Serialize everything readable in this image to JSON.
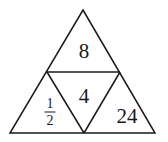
{
  "figure": {
    "name": "subdivided-equilateral-triangle",
    "background_color": "#ffffff",
    "stroke_color": "#1a1a1a",
    "stroke_width": 1.5,
    "outer_triangle": {
      "apex": {
        "x": 83,
        "y": 10
      },
      "bottom_left": {
        "x": 10,
        "y": 133
      },
      "bottom_right": {
        "x": 155,
        "y": 133
      }
    },
    "midpoints": {
      "left_side": {
        "x": 47,
        "y": 72
      },
      "right_side": {
        "x": 120,
        "y": 72
      },
      "base": {
        "x": 84,
        "y": 133
      }
    },
    "regions": [
      {
        "id": "top",
        "position": "top",
        "label": "8",
        "label_type": "integer",
        "orientation": "upward"
      },
      {
        "id": "center",
        "position": "center-inverted",
        "label": "4",
        "label_type": "integer",
        "orientation": "downward"
      },
      {
        "id": "bottom-left",
        "position": "bottom-left",
        "label": "1/2",
        "label_type": "fraction",
        "numerator": "1",
        "denominator": "2",
        "orientation": "upward"
      },
      {
        "id": "bottom-right",
        "position": "bottom-right",
        "label": "24",
        "label_type": "integer",
        "orientation": "upward"
      }
    ]
  }
}
